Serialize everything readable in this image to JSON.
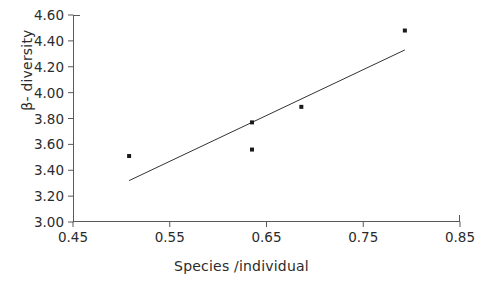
{
  "chart_data": {
    "type": "scatter",
    "title": "",
    "xlabel": "Species /individual",
    "ylabel": "β- diversity",
    "xlim": [
      0.45,
      0.85
    ],
    "ylim": [
      3.0,
      4.6
    ],
    "xticks": [
      "0.45",
      "0.55",
      "0.65",
      "0.75",
      "0.85"
    ],
    "xtick_values": [
      0.45,
      0.55,
      0.65,
      0.75,
      0.85
    ],
    "yticks": [
      "3.00",
      "3.20",
      "3.40",
      "3.60",
      "3.80",
      "4.00",
      "4.20",
      "4.40",
      "4.60"
    ],
    "ytick_values": [
      3.0,
      3.2,
      3.4,
      3.6,
      3.8,
      4.0,
      4.2,
      4.4,
      4.6
    ],
    "grid": false,
    "legend": false,
    "marker": "square",
    "marker_color": "#1a1a1a",
    "marker_size": 4,
    "axis_color": "#595959",
    "series": [
      {
        "name": "observations",
        "x": [
          0.508,
          0.635,
          0.635,
          0.686,
          0.793
        ],
        "y": [
          3.51,
          3.77,
          3.56,
          3.89,
          4.48
        ]
      }
    ],
    "points": [
      {
        "x": 0.508,
        "y": 3.51
      },
      {
        "x": 0.635,
        "y": 3.77
      },
      {
        "x": 0.635,
        "y": 3.56
      },
      {
        "x": 0.686,
        "y": 3.89
      },
      {
        "x": 0.793,
        "y": 4.48
      }
    ],
    "trendline": {
      "type": "linear",
      "x_start": 0.508,
      "y_start": 3.32,
      "x_end": 0.793,
      "y_end": 4.33,
      "color": "#333333",
      "width": 1
    }
  }
}
